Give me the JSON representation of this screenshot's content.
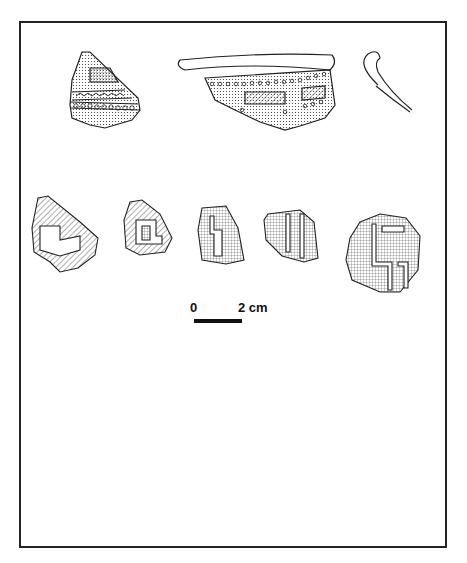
{
  "figure": {
    "scale_bar": {
      "start_label": "0",
      "end_label": "2 cm"
    },
    "rows": [
      {
        "name": "row-1",
        "items": [
          "sherd-chevron-band",
          "rim-sherd-rectangles",
          "rim-profile-1"
        ]
      },
      {
        "name": "row-2",
        "items": [
          "sherd-stepped-1",
          "sherd-stepped-2",
          "sherd-stepped-3",
          "sherd-stepped-4",
          "sherd-stepped-5"
        ]
      },
      {
        "name": "row-3",
        "items": [
          "sherd-scallop-1",
          "sherd-scallop-2",
          "sherd-scallop-3"
        ]
      },
      {
        "name": "row-4",
        "items": [
          "sherd-scallop-4",
          "sherd-scallop-5",
          "rim-sherd-dots",
          "rim-profile-2"
        ]
      }
    ]
  },
  "colors": {
    "ink": "#222222",
    "paper": "#ffffff"
  }
}
